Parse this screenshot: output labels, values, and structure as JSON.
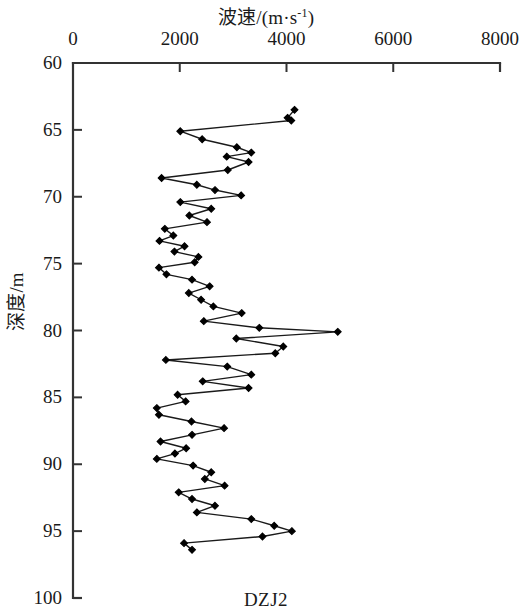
{
  "figure": {
    "caption": "DZJ2",
    "top_axis_title_main": "波速/(m·s",
    "top_axis_title_sup": "-1",
    "top_axis_title_close": ")",
    "top_axis_title_full": "波速/(m·s⁻¹)",
    "left_axis_title": "深度/m",
    "line_color": "#1a1a1a",
    "marker_color": "#000000",
    "axis_color": "#333333",
    "background_color": "#ffffff"
  },
  "chart_data": {
    "type": "line",
    "title": "DZJ2",
    "xlabel": "波速/(m·s⁻¹)",
    "ylabel": "深度/m",
    "orientation": "vertical-profile",
    "x_axis_position": "top",
    "y_axis_inverted": true,
    "xlim": [
      0,
      8000
    ],
    "ylim": [
      60,
      100
    ],
    "xticks": [
      0,
      2000,
      4000,
      6000,
      8000
    ],
    "yticks": [
      60,
      65,
      70,
      75,
      80,
      85,
      90,
      95,
      100
    ],
    "xtick_labels": [
      "0",
      "2000",
      "4000",
      "6000",
      "8000"
    ],
    "ytick_labels": [
      "60",
      "65",
      "70",
      "75",
      "80",
      "85",
      "90",
      "95",
      "100"
    ],
    "grid": false,
    "legend": null,
    "series": [
      {
        "name": "DZJ2",
        "marker": "diamond",
        "depth": [
          63.5,
          64.1,
          64.3,
          65.1,
          65.7,
          66.3,
          66.7,
          67.0,
          67.4,
          68.0,
          68.6,
          69.1,
          69.5,
          69.9,
          70.4,
          70.9,
          71.4,
          71.9,
          72.4,
          72.9,
          73.3,
          73.7,
          74.1,
          74.5,
          74.9,
          75.3,
          75.8,
          76.2,
          76.7,
          77.2,
          77.7,
          78.2,
          78.7,
          79.3,
          79.8,
          80.1,
          80.6,
          81.2,
          81.7,
          82.2,
          82.7,
          83.3,
          83.8,
          84.3,
          84.8,
          85.3,
          85.8,
          86.3,
          86.8,
          87.3,
          87.8,
          88.3,
          88.8,
          89.2,
          89.6,
          90.1,
          90.6,
          91.1,
          91.6,
          92.1,
          92.6,
          93.1,
          93.6,
          94.1,
          94.6,
          95.0,
          95.4,
          95.9,
          96.4
        ],
        "velocity": [
          4150,
          4020,
          4090,
          2010,
          2420,
          3070,
          3340,
          2880,
          3290,
          2900,
          1660,
          2320,
          2660,
          3150,
          2010,
          2590,
          2180,
          2510,
          1720,
          1880,
          1620,
          2090,
          1900,
          2350,
          2280,
          1610,
          1750,
          2230,
          2560,
          2170,
          2400,
          2630,
          3160,
          2450,
          3490,
          4960,
          3060,
          3940,
          3790,
          1740,
          2890,
          3340,
          2430,
          3290,
          1960,
          2110,
          1570,
          1610,
          2220,
          2830,
          2230,
          1640,
          2120,
          1910,
          1570,
          2250,
          2590,
          2470,
          2840,
          1980,
          2230,
          2660,
          2320,
          3340,
          3770,
          4100,
          3550,
          2080,
          2230
        ]
      }
    ]
  }
}
